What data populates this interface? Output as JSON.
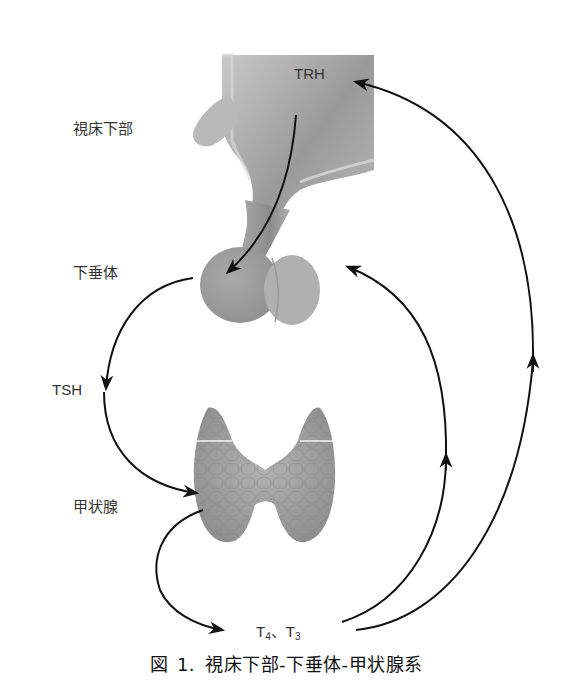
{
  "labels": {
    "hypothalamus": "視床下部",
    "pituitary": "下垂体",
    "tsh": "TSH",
    "thyroid": "甲状腺",
    "trh": "TRH",
    "t4": "T",
    "t4_sub": "4",
    "sep": "、",
    "t3": "T",
    "t3_sub": "3"
  },
  "caption": {
    "prefix": "図",
    "number": "1.",
    "title": "視床下部-下垂体-甲状腺系"
  },
  "colors": {
    "arrow": "#111111",
    "tissue_light": "#b8b8b8",
    "tissue_dark": "#8a8a8a",
    "thyroid": "#9e9e9e"
  }
}
